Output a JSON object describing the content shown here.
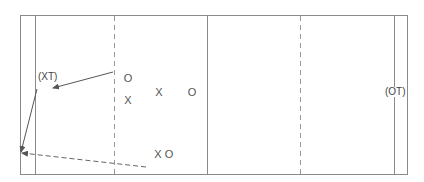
{
  "diagram": {
    "type": "court-play-diagram",
    "colors": {
      "line": "#8a8a8a",
      "dash": "#999999",
      "arrow": "#555555",
      "text": "#444444",
      "background": "#ffffff"
    },
    "court": {
      "outer": {
        "x1": 20,
        "y1": 15,
        "x2": 408,
        "y2": 175
      },
      "inner_lines_x": [
        35,
        394
      ],
      "center_line_x": 207,
      "dashed_lines_x": [
        114,
        300
      ]
    },
    "labels": {
      "xt": "(XT)",
      "ot": "(OT)"
    },
    "players": [
      {
        "id": "o1",
        "symbol": "O",
        "x": 128,
        "y": 78
      },
      {
        "id": "x1",
        "symbol": "X",
        "x": 128,
        "y": 100
      },
      {
        "id": "x2",
        "symbol": "X",
        "x": 159,
        "y": 92
      },
      {
        "id": "o2",
        "symbol": "O",
        "x": 192,
        "y": 92
      },
      {
        "id": "x3",
        "symbol": "X",
        "x": 158,
        "y": 154
      },
      {
        "id": "o3",
        "symbol": "O",
        "x": 169,
        "y": 154
      }
    ],
    "arrows": [
      {
        "id": "pass-to-xt",
        "style": "solid",
        "from": [
          113,
          72
        ],
        "to": [
          53,
          88
        ]
      },
      {
        "id": "xt-run",
        "style": "solid",
        "from": [
          37,
          89
        ],
        "to": [
          21,
          152
        ]
      },
      {
        "id": "dashed-pass",
        "style": "dashed",
        "from": [
          146,
          167
        ],
        "to": [
          22,
          153
        ]
      }
    ]
  }
}
